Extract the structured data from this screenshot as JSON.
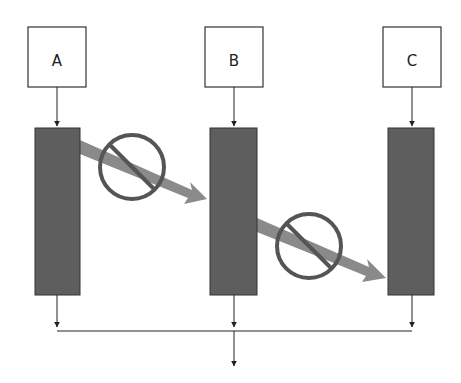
{
  "diagram": {
    "nodes": [
      {
        "id": "A",
        "label": "A"
      },
      {
        "id": "B",
        "label": "B"
      },
      {
        "id": "C",
        "label": "C"
      }
    ],
    "blocked_transfers": [
      {
        "from": "A",
        "to": "B",
        "symbol": "prohibited-icon"
      },
      {
        "from": "B",
        "to": "C",
        "symbol": "prohibited-icon"
      }
    ],
    "colors": {
      "bar_fill": "#5e5e5e",
      "arrow_fill": "#8a8a8a",
      "prohibit_stroke": "#555555",
      "line": "#222222"
    }
  }
}
